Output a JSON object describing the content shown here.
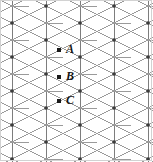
{
  "figure": {
    "width": 153,
    "height": 162,
    "background_color": "#ffffff",
    "border_color": "#d2d2d2"
  },
  "lattice": {
    "type": "rhombille-tiling",
    "line_color": "#9a9a9a",
    "line_color_dark": "#7d7d7d",
    "node_color": "#3c3c3c",
    "line_width": 1,
    "column_spacing": 34,
    "row_spacing": 34,
    "vertical_line_x": [
      12,
      46,
      80,
      114,
      148
    ],
    "hub_row_y": [
      -11,
      23,
      57,
      91,
      125,
      159
    ],
    "diagonal_angle_degrees": 30
  },
  "labels": [
    {
      "id": "point-a",
      "text": "A",
      "x": 66,
      "y": 43,
      "dot_x": 59,
      "dot_y": 50
    },
    {
      "id": "point-b",
      "text": "B",
      "x": 66,
      "y": 70,
      "dot_x": 59,
      "dot_y": 77
    },
    {
      "id": "point-c",
      "text": "C",
      "x": 66,
      "y": 94,
      "dot_x": 59,
      "dot_y": 101
    }
  ]
}
